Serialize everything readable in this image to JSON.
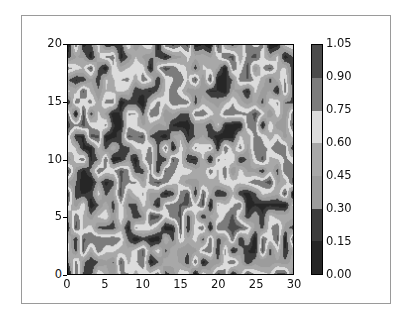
{
  "chart_data": {
    "type": "contourf",
    "title": "",
    "xlabel": "",
    "ylabel": "",
    "xlim": [
      0,
      30
    ],
    "ylim": [
      0,
      20
    ],
    "grid": false,
    "x_ticks": [
      "0",
      "5",
      "10",
      "15",
      "20",
      "25",
      "30"
    ],
    "y_ticks": [
      "0",
      "5",
      "10",
      "15",
      "20"
    ],
    "colorbar": {
      "levels": [
        0.0,
        0.15,
        0.3,
        0.45,
        0.6,
        0.75,
        0.9,
        1.05
      ],
      "tick_labels": [
        "0.00",
        "0.15",
        "0.30",
        "0.45",
        "0.60",
        "0.75",
        "0.90",
        "1.05"
      ],
      "band_colors": [
        "#262626",
        "#3c3c3c",
        "#9c9c9c",
        "#a8a8a8",
        "#dcdcdc",
        "#7c7c7c",
        "#4c4c4c"
      ]
    },
    "data_description": "Random noise field on a 31x21 grid (x 0-30, y 0-20), values uniformly in [0,1]",
    "grid_size": [
      31,
      21
    ],
    "seed": 7
  }
}
